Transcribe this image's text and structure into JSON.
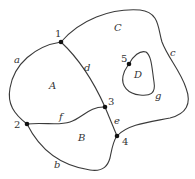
{
  "diagram": {
    "type": "planar-graph",
    "nodes": [
      {
        "id": "1",
        "label": "1",
        "x": 61,
        "y": 42
      },
      {
        "id": "2",
        "label": "2",
        "x": 27,
        "y": 124
      },
      {
        "id": "3",
        "label": "3",
        "x": 105,
        "y": 107
      },
      {
        "id": "4",
        "label": "4",
        "x": 117,
        "y": 136
      },
      {
        "id": "5",
        "label": "5",
        "x": 129,
        "y": 64
      }
    ],
    "edges": [
      {
        "id": "a",
        "label": "a",
        "from": "1",
        "to": "2"
      },
      {
        "id": "b",
        "label": "b",
        "from": "2",
        "to": "4"
      },
      {
        "id": "c",
        "label": "c",
        "from": "1",
        "to": "4"
      },
      {
        "id": "d",
        "label": "d",
        "from": "1",
        "to": "3"
      },
      {
        "id": "e",
        "label": "e",
        "from": "3",
        "to": "4"
      },
      {
        "id": "f",
        "label": "f",
        "from": "2",
        "to": "3"
      },
      {
        "id": "g",
        "label": "g",
        "from": "5",
        "to": "5"
      }
    ],
    "regions": [
      {
        "id": "A",
        "label": "A"
      },
      {
        "id": "B",
        "label": "B"
      },
      {
        "id": "C",
        "label": "C"
      },
      {
        "id": "D",
        "label": "D"
      }
    ]
  }
}
